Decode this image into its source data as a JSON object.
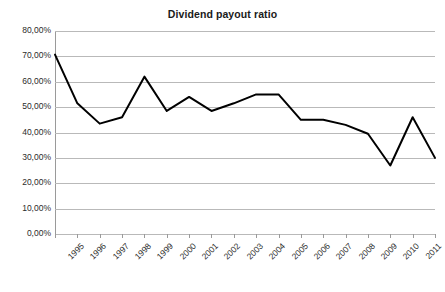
{
  "chart_data": {
    "type": "line",
    "title": "Dividend payout ratio",
    "xlabel": "",
    "ylabel": "",
    "categories": [
      "1995",
      "1996",
      "1997",
      "1998",
      "1999",
      "2000",
      "2001",
      "2002",
      "2003",
      "2004",
      "2005",
      "2006",
      "2007",
      "2008",
      "2009",
      "2010",
      "2011",
      "2012"
    ],
    "series": [
      {
        "name": "Dividend payout ratio",
        "color": "#000000",
        "values": [
          70.7,
          51.5,
          43.5,
          46.0,
          62.0,
          48.5,
          54.0,
          48.5,
          51.5,
          55.0,
          55.0,
          45.0,
          45.0,
          43.0,
          39.5,
          27.0,
          46.0,
          30.0
        ]
      }
    ],
    "ylim": [
      0,
      80
    ],
    "ytick_values": [
      0,
      10,
      20,
      30,
      40,
      50,
      60,
      70,
      80
    ],
    "ytick_labels": [
      "0,00%",
      "10,00%",
      "20,00%",
      "30,00%",
      "40,00%",
      "50,00%",
      "60,00%",
      "70,00%",
      "80,00%"
    ],
    "grid": "horizontal",
    "grid_color": "#b9b9b9",
    "legend": "none",
    "xtick_rotation": -45,
    "background": "#ffffff"
  }
}
